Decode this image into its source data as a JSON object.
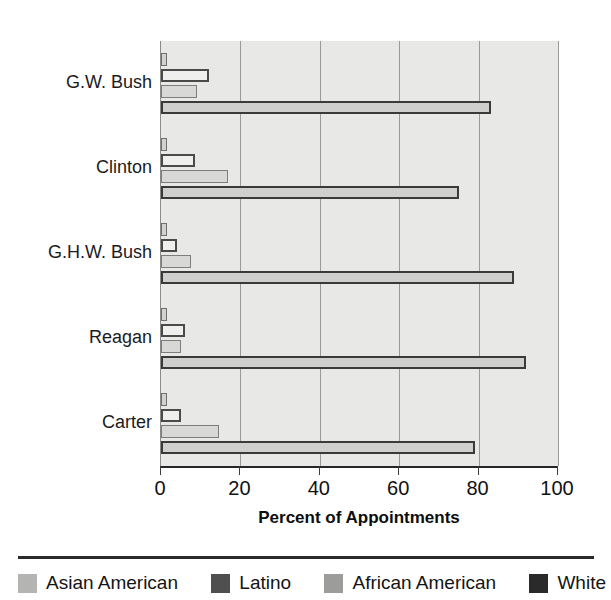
{
  "chart_data": {
    "type": "bar",
    "orientation": "horizontal",
    "title": "",
    "xlabel": "Percent of Appointments",
    "ylabel": "",
    "xlim": [
      0,
      100
    ],
    "ylim": null,
    "grid": true,
    "legend_position": "bottom",
    "xticks": [
      0,
      20,
      40,
      60,
      80,
      100
    ],
    "xticklabels": [
      "0",
      "20",
      "40",
      "60",
      "80",
      "100"
    ],
    "categories": [
      "G.W. Bush",
      "Clinton",
      "G.H.W. Bush",
      "Reagan",
      "Carter"
    ],
    "series": [
      {
        "name": "Asian American",
        "color": "#d2d2d0",
        "values": [
          1,
          1,
          1,
          0.7,
          1
        ]
      },
      {
        "name": "Latino",
        "color": "#efefed",
        "values": [
          12,
          8.5,
          4,
          6,
          5
        ]
      },
      {
        "name": "African American",
        "color": "#d8d8d6",
        "values": [
          9,
          17,
          7.5,
          5,
          14.5
        ]
      },
      {
        "name": "White",
        "color": "#cfcfcd",
        "values": [
          83,
          75,
          89,
          92,
          79
        ]
      }
    ]
  },
  "legend": {
    "items": [
      {
        "label": "Asian American",
        "swatch_color": "#b4b4b2"
      },
      {
        "label": "Latino",
        "swatch_color": "#4f4f4f"
      },
      {
        "label": "African American",
        "swatch_color": "#9c9c9a"
      },
      {
        "label": "White",
        "swatch_color": "#2a2a2a"
      }
    ]
  },
  "axis": {
    "x_title": "Percent of Appointments"
  }
}
